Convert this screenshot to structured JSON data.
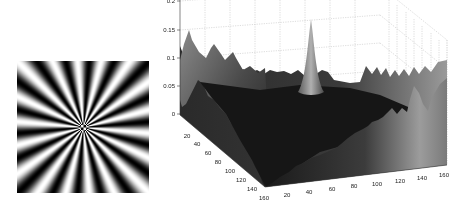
{
  "figure": {
    "left_panel": {
      "type": "image",
      "description": "radial sinusoidal star pattern (Siemens star)",
      "spokes": 18
    },
    "right_panel": {
      "type": "3d-surface"
    }
  },
  "chart_data": [
    {
      "type": "image",
      "title": "",
      "content": "radial grayscale star pattern with ~18 dark/light spoke cycles converging at center"
    },
    {
      "type": "surface",
      "title": "",
      "xlabel": "",
      "ylabel": "",
      "zlabel": "",
      "x_ticks": [
        "20",
        "40",
        "60",
        "80",
        "100",
        "120",
        "140",
        "160"
      ],
      "y_ticks": [
        "20",
        "40",
        "60",
        "80",
        "100",
        "120",
        "140",
        "160"
      ],
      "z_ticks": [
        "0",
        "0.05",
        "0.1",
        "0.15",
        "0.2"
      ],
      "xlim": [
        0,
        160
      ],
      "ylim": [
        0,
        160
      ],
      "zlim": [
        0,
        0.2
      ],
      "grid": true,
      "features": {
        "central_spike": {
          "x": 80,
          "y": 80,
          "z": 0.2
        },
        "left_edge_peak_z": 0.15,
        "edge_ridge_z": 0.1,
        "valley_floor_z": 0.02
      },
      "colormap": "gray"
    }
  ],
  "axes": {
    "z_ticks": [
      "0.2",
      "0.15",
      "0.1",
      "0.05",
      "0"
    ],
    "left_ticks": [
      "20",
      "40",
      "60",
      "80",
      "100",
      "120",
      "140",
      "160"
    ],
    "right_ticks": [
      "20",
      "40",
      "60",
      "80",
      "100",
      "120",
      "140",
      "160"
    ]
  }
}
